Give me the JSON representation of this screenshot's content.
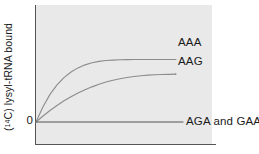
{
  "figure": {
    "background_color": "#ffffff",
    "panel_color": "#e9e9e9",
    "axis_color": "#555555",
    "curve_color": "#8c8c8c",
    "text_color": "#1a1a1a"
  },
  "axes": {
    "y_title_prefix": "(",
    "y_title_superscript": "14",
    "y_title_suffix": "C) lysyl-tRNA bound",
    "y_title_full": "(14C) lysyl-tRNA bound",
    "y_tick_zero": "0",
    "x_title": ""
  },
  "labels": {
    "aaa": "AAA",
    "aag": "AAG",
    "flat": "AGA and GAA"
  },
  "chart_data": {
    "type": "line",
    "title": "",
    "xlabel": "",
    "ylabel": "(14C) lysyl-tRNA bound",
    "xlim": [
      0,
      100
    ],
    "ylim": [
      0,
      100
    ],
    "grid": false,
    "legend": "inline-right-end-of-curve",
    "x_ticks": [],
    "y_ticks": [
      "0"
    ],
    "x": [
      0,
      5,
      10,
      15,
      20,
      25,
      30,
      35,
      40,
      45,
      50,
      55,
      60,
      65,
      70,
      75,
      80,
      85,
      90,
      95,
      100
    ],
    "series": [
      {
        "name": "AAA",
        "label": "AAA",
        "color": "#8c8c8c",
        "shape": "saturating-hyperbolic",
        "plateau": 68,
        "values": [
          0,
          16.5,
          30.0,
          40.3,
          48.3,
          54.3,
          58.8,
          62.1,
          64.4,
          65.9,
          66.8,
          67.3,
          67.6,
          67.8,
          67.9,
          68.0,
          68.0,
          68.0,
          68.0,
          68.0,
          68.0
        ]
      },
      {
        "name": "AAG",
        "label": "AAG",
        "color": "#8c8c8c",
        "shape": "saturating-hyperbolic",
        "plateau": 52,
        "values": [
          0,
          6.5,
          12.5,
          18.0,
          23.0,
          27.5,
          31.5,
          35.0,
          38.2,
          41.0,
          43.4,
          45.4,
          47.1,
          48.4,
          49.5,
          50.3,
          50.9,
          51.3,
          51.6,
          51.8,
          52.0
        ]
      },
      {
        "name": "AGA and GAA",
        "label": "AGA and GAA",
        "color": "#555555",
        "shape": "flat",
        "plateau": 0,
        "values": [
          0,
          0,
          0,
          0,
          0,
          0,
          0,
          0,
          0,
          0,
          0,
          0,
          0,
          0,
          0,
          0,
          0,
          0,
          0,
          0,
          0
        ]
      }
    ]
  }
}
